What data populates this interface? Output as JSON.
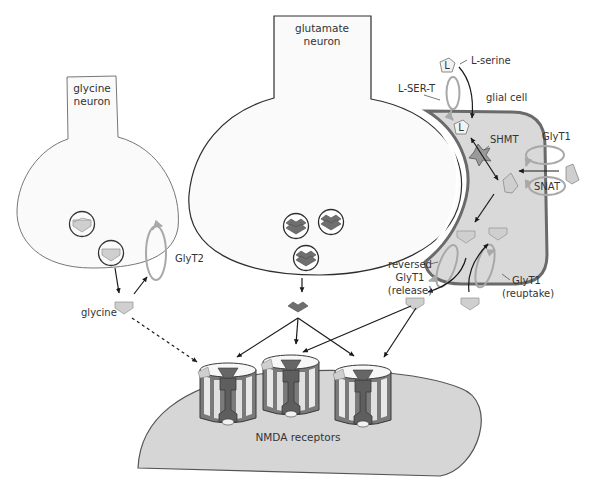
{
  "diagram": {
    "colors": {
      "outline": "#555555",
      "neuron_fill": "#fafafa",
      "glial_fill": "#d9d9d9",
      "glial_border": "#6a6a6a",
      "transporter": "#a8a8a8",
      "glycine": "#cfcfcf",
      "glutamate": "#6f6f6f",
      "postsynaptic_fill": "#d6d6d6",
      "arrow": "#1a1a1a"
    },
    "glycine_neuron": {
      "label_line1": "glycine",
      "label_line2": "neuron",
      "transporter_label": "GlyT2",
      "released_label": "glycine"
    },
    "glutamate_neuron": {
      "label_line1": "glutamate",
      "label_line2": "neuron"
    },
    "glial_cell": {
      "label": "glial cell",
      "l_serine_label": "L-serine",
      "l_ser_t_label": "L-SER-T",
      "shmt_label": "SHMT",
      "glyt1_label": "GlyT1",
      "snat_label": "SNAT",
      "l_symbol": "L",
      "reversed_label_line1": "reversed",
      "reversed_label_line2": "GlyT1",
      "reversed_label_line3": "(release)",
      "reuptake_label_line1": "GlyT1",
      "reuptake_label_line2": "(reuptake)"
    },
    "postsynaptic": {
      "label": "NMDA receptors",
      "receptor_count": 3
    }
  }
}
